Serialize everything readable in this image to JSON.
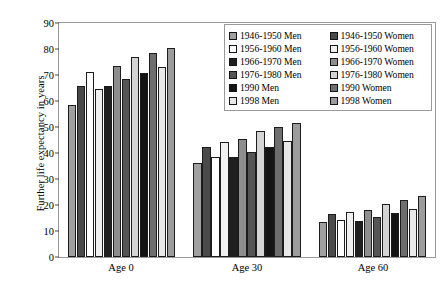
{
  "chart_data": {
    "type": "bar",
    "title": "",
    "xlabel": "",
    "ylabel": "Further life expectancy in years",
    "categories": [
      "Age 0",
      "Age 30",
      "Age 60"
    ],
    "ylim": [
      0,
      90
    ],
    "yticks": [
      0,
      10,
      20,
      30,
      40,
      50,
      60,
      70,
      80,
      90
    ],
    "grid": false,
    "legend_position": "top-right-inside",
    "series": [
      {
        "name": "1946-1950 Men",
        "color": "#a0a0a0",
        "values": [
          58.5,
          36.2,
          13.6
        ]
      },
      {
        "name": "1946-1950 Women",
        "color": "#4a4a4a",
        "values": [
          65.8,
          42.3,
          16.7
        ]
      },
      {
        "name": "1956-1960 Men",
        "color": "#ffffff",
        "values": [
          71.3,
          38.4,
          14.1
        ]
      },
      {
        "name": "1956-1960 Women",
        "color": "#f0f0f0",
        "values": [
          64.7,
          44.1,
          17.4
        ]
      },
      {
        "name": "1966-1970 Men",
        "color": "#1f1f1f",
        "values": [
          65.8,
          38.4,
          14.0
        ]
      },
      {
        "name": "1966-1970 Women",
        "color": "#8e8e8e",
        "values": [
          73.3,
          45.2,
          18.0
        ]
      },
      {
        "name": "1976-1980 Men",
        "color": "#555555",
        "values": [
          68.5,
          40.2,
          15.4
        ]
      },
      {
        "name": "1976-1980 Women",
        "color": "#d4d4d4",
        "values": [
          76.8,
          48.3,
          20.4
        ]
      },
      {
        "name": "1990 Men",
        "color": "#141414",
        "values": [
          70.8,
          42.5,
          16.9
        ]
      },
      {
        "name": "1990 Women",
        "color": "#6e6e6e",
        "values": [
          78.5,
          49.9,
          21.8
        ]
      },
      {
        "name": "1998 Men",
        "color": "#e8e8e8",
        "values": [
          73.2,
          44.5,
          18.4
        ]
      },
      {
        "name": "1998 Women",
        "color": "#9c9c9c",
        "values": [
          80.5,
          51.4,
          23.4
        ]
      }
    ]
  }
}
